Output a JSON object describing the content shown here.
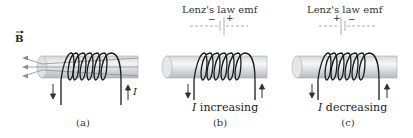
{
  "panels": [
    {
      "id": "a",
      "caption": "(a)",
      "field_label": "B",
      "current_label": "I",
      "field_arrows": 3
    },
    {
      "id": "b",
      "caption": "(b)",
      "title": "Lenz's law emf",
      "polarity_left": "−",
      "polarity_right": "+",
      "current_symbol": "I",
      "status_text": "increasing"
    },
    {
      "id": "c",
      "caption": "(c)",
      "title": "Lenz's law emf",
      "polarity_left": "+",
      "polarity_right": "−",
      "current_symbol": "I",
      "status_text": "decreasing"
    }
  ],
  "colors": {
    "wire": "#1a1a1a",
    "rod_light": "#e8e9ea",
    "rod_dark": "#b9bcbf",
    "field_line": "#8a8f96",
    "dashed": "#9a9a9a"
  }
}
